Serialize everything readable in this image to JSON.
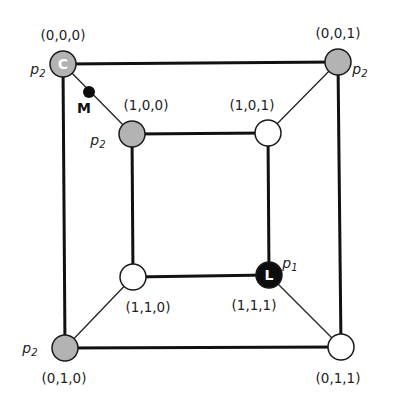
{
  "diagram": {
    "type": "hypercube-graph",
    "nodes": [
      {
        "id": "n000",
        "label": "(0,0,0)",
        "x": 63,
        "y": 64,
        "fill": "gray",
        "player": "p",
        "player_sub": "2",
        "marker": "C",
        "lx": 63,
        "ly": 40,
        "px": 38,
        "py": 74
      },
      {
        "id": "n001",
        "label": "(0,0,1)",
        "x": 338,
        "y": 62,
        "fill": "gray",
        "player": "p",
        "player_sub": "2",
        "marker": "",
        "lx": 338,
        "ly": 38,
        "px": 360,
        "py": 74
      },
      {
        "id": "n100",
        "label": "(1,0,0)",
        "x": 132,
        "y": 134,
        "fill": "gray",
        "player": "p",
        "player_sub": "2",
        "marker": "",
        "lx": 146,
        "ly": 110,
        "px": 98,
        "py": 145
      },
      {
        "id": "n101",
        "label": "(1,0,1)",
        "x": 268,
        "y": 133,
        "fill": "white",
        "player": "",
        "player_sub": "",
        "marker": "",
        "lx": 252,
        "ly": 110,
        "px": 0,
        "py": 0
      },
      {
        "id": "n110",
        "label": "(1,1,0)",
        "x": 133,
        "y": 277,
        "fill": "white",
        "player": "",
        "player_sub": "",
        "marker": "",
        "lx": 148,
        "ly": 312,
        "px": 0,
        "py": 0
      },
      {
        "id": "n111",
        "label": "(1,1,1)",
        "x": 269,
        "y": 275,
        "fill": "black",
        "player": "p",
        "player_sub": "1",
        "marker": "L",
        "lx": 254,
        "ly": 310,
        "px": 290,
        "py": 268
      },
      {
        "id": "n010",
        "label": "(0,1,0)",
        "x": 65,
        "y": 348,
        "fill": "gray",
        "player": "p",
        "player_sub": "2",
        "marker": "",
        "lx": 64,
        "ly": 383,
        "px": 30,
        "py": 353
      },
      {
        "id": "n011",
        "label": "(0,1,1)",
        "x": 341,
        "y": 347,
        "fill": "white",
        "player": "",
        "player_sub": "",
        "marker": "",
        "lx": 338,
        "ly": 383,
        "px": 0,
        "py": 0
      }
    ],
    "edges": [
      {
        "from": "n000",
        "to": "n001",
        "weight": "thick"
      },
      {
        "from": "n000",
        "to": "n010",
        "weight": "thick"
      },
      {
        "from": "n001",
        "to": "n011",
        "weight": "thick"
      },
      {
        "from": "n010",
        "to": "n011",
        "weight": "thick"
      },
      {
        "from": "n100",
        "to": "n101",
        "weight": "thick"
      },
      {
        "from": "n100",
        "to": "n110",
        "weight": "thick"
      },
      {
        "from": "n101",
        "to": "n111",
        "weight": "thick"
      },
      {
        "from": "n110",
        "to": "n111",
        "weight": "thick"
      },
      {
        "from": "n000",
        "to": "n100",
        "weight": "thin"
      },
      {
        "from": "n001",
        "to": "n101",
        "weight": "thin"
      },
      {
        "from": "n010",
        "to": "n110",
        "weight": "thin"
      },
      {
        "from": "n011",
        "to": "n111",
        "weight": "thin"
      }
    ],
    "extra_marker": {
      "label": "M",
      "x": 89,
      "y": 92,
      "lx": 84,
      "ly": 113
    },
    "colors": {
      "gray": "#b3b3b3",
      "white": "#ffffff",
      "black": "#0d0d0d",
      "stroke": "#1a1a1a"
    }
  }
}
